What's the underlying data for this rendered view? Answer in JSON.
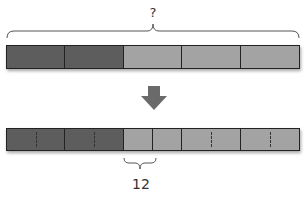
{
  "top": {
    "label": "?",
    "segments": [
      {
        "color": "#5d5d5d"
      },
      {
        "color": "#5d5d5d"
      },
      {
        "color": "#a3a3a3"
      },
      {
        "color": "#a3a3a3"
      },
      {
        "color": "#a3a3a3"
      }
    ]
  },
  "arrow": {
    "color": "#6a6a6a",
    "icon": "down-arrow-icon"
  },
  "bottom": {
    "label": "12",
    "segments": [
      {
        "color": "#5d5d5d",
        "dashed": true
      },
      {
        "color": "#5d5d5d",
        "dashed": true
      },
      {
        "color": "#a3a3a3",
        "dashed": false,
        "split": true
      },
      {
        "color": "#a3a3a3",
        "dashed": true
      },
      {
        "color": "#a3a3a3",
        "dashed": true
      }
    ]
  }
}
